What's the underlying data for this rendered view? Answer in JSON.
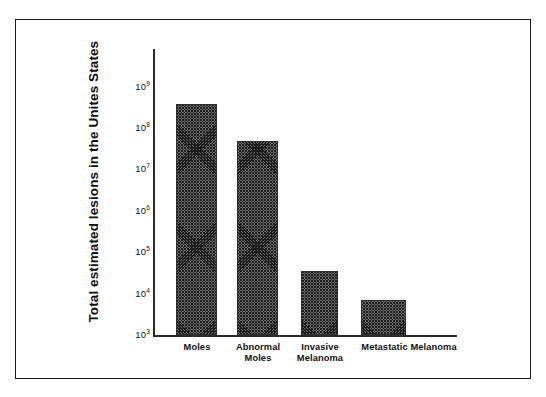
{
  "chart_data": {
    "type": "bar",
    "title": "",
    "xlabel": "",
    "ylabel": "Total estimated lesions in the Unites States",
    "categories": [
      "Moles",
      "Abnormal Moles",
      "Invasive Melanoma",
      "Metastatic Melanoma"
    ],
    "values": [
      400000000,
      50000000,
      35000,
      7000
    ],
    "yscale": "log",
    "ylim": [
      1000,
      2500000000
    ],
    "ytick_values": [
      1000,
      10000,
      100000,
      1000000,
      10000000,
      100000000,
      1000000000
    ],
    "ytick_labels": [
      "10³",
      "10⁴",
      "10⁵",
      "10⁶",
      "10⁷",
      "10⁸",
      "10⁹"
    ],
    "grid": false,
    "legend": false,
    "bar_fill": "#6d6d6d",
    "bar_edge": "#2e2e2e",
    "axis_color": "#2b2b2b",
    "frame_color": "#1a1a1a"
  },
  "axis": {
    "y_title": "Total estimated lesions in the Unites States",
    "ticks": [
      {
        "mantissa": "10",
        "exponent": "9"
      },
      {
        "mantissa": "10",
        "exponent": "8"
      },
      {
        "mantissa": "10",
        "exponent": "7"
      },
      {
        "mantissa": "10",
        "exponent": "6"
      },
      {
        "mantissa": "10",
        "exponent": "5"
      },
      {
        "mantissa": "10",
        "exponent": "4"
      },
      {
        "mantissa": "10",
        "exponent": "3"
      }
    ]
  },
  "categories": [
    {
      "line1": "Moles",
      "line2": ""
    },
    {
      "line1": "Abnormal",
      "line2": "Moles"
    },
    {
      "line1": "Invasive",
      "line2": "Melanoma"
    },
    {
      "line1": "Metastatic Melanoma",
      "line2": ""
    }
  ]
}
